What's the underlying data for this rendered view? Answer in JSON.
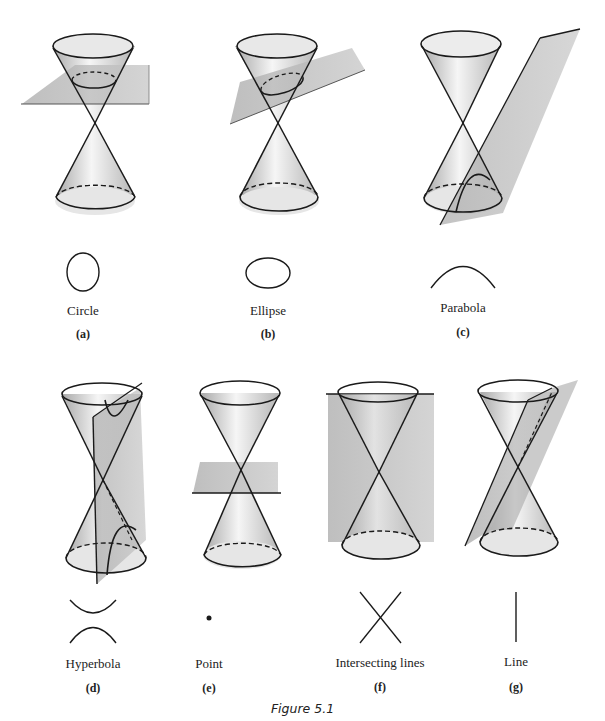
{
  "figure": {
    "caption": "Figure 5.1",
    "panels": [
      {
        "tag": "(a)",
        "label": "Circle",
        "curve": "circle"
      },
      {
        "tag": "(b)",
        "label": "Ellipse",
        "curve": "ellipse"
      },
      {
        "tag": "(c)",
        "label": "Parabola",
        "curve": "parabola"
      },
      {
        "tag": "(d)",
        "label": "Hyperbola",
        "curve": "hyperbola"
      },
      {
        "tag": "(e)",
        "label": "Point",
        "curve": "point"
      },
      {
        "tag": "(f)",
        "label": "Intersecting lines",
        "curve": "intersecting-lines"
      },
      {
        "tag": "(g)",
        "label": "Line",
        "curve": "line"
      }
    ]
  },
  "colors": {
    "stroke": "#1a1a1a",
    "plane": "#b5b5b5",
    "cone_shade": "#cfcfcf"
  }
}
